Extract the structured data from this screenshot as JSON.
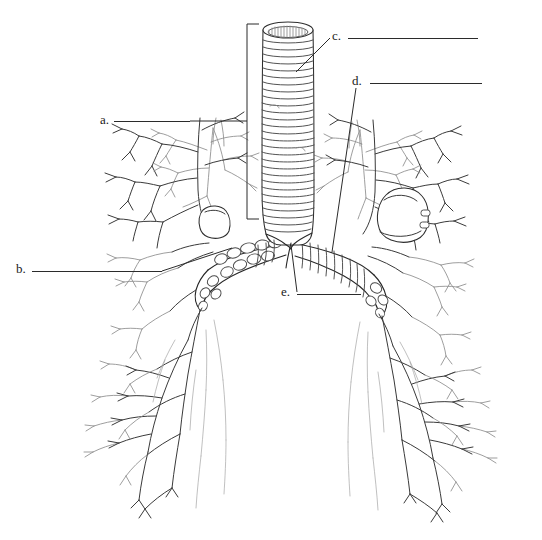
{
  "figure": {
    "background_color": "#ffffff",
    "stroke_color": "#3a3a3a",
    "stroke_color_dark": "#1f1f1f",
    "stroke_color_light": "#8a8a8a",
    "leader_color": "#2b2b2b",
    "canvas": {
      "width": 542,
      "height": 540
    }
  },
  "labels": [
    {
      "key": "a",
      "text": "a.",
      "text_x": 100,
      "text_y": 113,
      "blank_x": 114,
      "blank_y": 121,
      "blank_width": 76,
      "leader": "horizontal-right-to-bracket"
    },
    {
      "key": "b",
      "text": "b.",
      "text_x": 16,
      "text_y": 262,
      "blank_x": 32,
      "blank_y": 271,
      "blank_width": 130,
      "leader": "horizontal-right-to-left-bronchus"
    },
    {
      "key": "c",
      "text": "c.",
      "text_x": 332,
      "text_y": 29,
      "blank_x": 348,
      "blank_y": 38,
      "blank_width": 130,
      "leader": "diagonal-down-left-to-trachea"
    },
    {
      "key": "d",
      "text": "d.",
      "text_x": 352,
      "text_y": 74,
      "blank_x": 370,
      "blank_y": 83,
      "blank_width": 112,
      "leader": "vertical-down-into-right-lung"
    },
    {
      "key": "e",
      "text": "e.",
      "text_x": 281,
      "text_y": 285,
      "blank_x": 297,
      "blank_y": 294,
      "blank_width": 64,
      "leader": "diagonal-up-right-to-carina"
    }
  ],
  "leader_lines": [
    {
      "name": "leader-a",
      "x1": 190,
      "y1": 121,
      "x2": 247,
      "y2": 121
    },
    {
      "name": "leader-b",
      "x1": 162,
      "y1": 271,
      "x2": 232,
      "y2": 248
    },
    {
      "name": "leader-c",
      "x1": 330,
      "y1": 38,
      "x2": 296,
      "y2": 72
    },
    {
      "name": "leader-d",
      "x1": 356,
      "y1": 88,
      "x2": 332,
      "y2": 252
    },
    {
      "name": "leader-e",
      "x1": 297,
      "y1": 292,
      "x2": 291,
      "y2": 245
    }
  ],
  "bracket": {
    "name": "trachea-bracket",
    "x": 247,
    "y_top": 24,
    "y_bottom": 219,
    "tick_length": 12
  },
  "anatomy": {
    "trachea": {
      "name": "trachea",
      "top_y": 22,
      "bottom_y": 228,
      "left_x": 262,
      "right_x": 306,
      "cartilage_ring_count": 30,
      "lumen_striation_count": 14
    },
    "carina": {
      "name": "carina",
      "x": 290,
      "y": 243
    },
    "bronchi": [
      {
        "name": "left-main-bronchus",
        "side": "left"
      },
      {
        "name": "right-main-bronchus",
        "side": "right"
      }
    ],
    "lungs": [
      {
        "name": "left-lung-bronchial-tree",
        "side": "left"
      },
      {
        "name": "right-lung-bronchial-tree",
        "side": "right"
      }
    ]
  }
}
